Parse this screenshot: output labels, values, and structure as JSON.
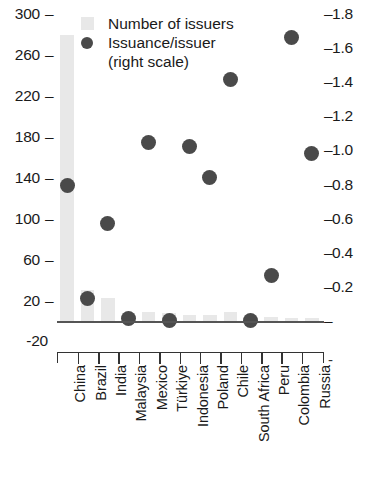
{
  "chart_data": {
    "type": "bar",
    "title": "",
    "subtitle": "",
    "xlabel": "",
    "ylabel": "",
    "y2label": "",
    "grid": false,
    "legend_position": "top-left",
    "categories": [
      "China",
      "Brazil",
      "India",
      "Malaysia",
      "Mexico",
      "Türkiye",
      "Indonesia",
      "Poland",
      "Chile",
      "South Africa",
      "Peru",
      "Colombia",
      "Russia"
    ],
    "ylim": [
      -20,
      300
    ],
    "y2lim": [
      0.0,
      1.8
    ],
    "yticks": [
      "300",
      "260",
      "220",
      "180",
      "140",
      "100",
      "60",
      "20",
      "-20"
    ],
    "ytick_values": [
      300,
      260,
      220,
      180,
      140,
      100,
      60,
      20,
      -20
    ],
    "y2ticks": [
      "1.8",
      "1.6",
      "1.4",
      "1.2",
      "1.0",
      "0.8",
      "0.6",
      "0.4",
      "0.2",
      "-"
    ],
    "y2tick_values": [
      1.8,
      1.6,
      1.4,
      1.2,
      1.0,
      0.8,
      0.6,
      0.4,
      0.2,
      0.0
    ],
    "series": [
      {
        "name": "Number of issuers",
        "type": "bar",
        "axis": "left",
        "color": "#e8e8e8",
        "values": [
          280,
          31,
          23,
          9,
          10,
          9,
          7,
          7,
          10,
          6,
          5,
          4,
          4
        ]
      },
      {
        "name": "Issuance/issuer (right scale)",
        "type": "scatter",
        "axis": "right",
        "color": "#4a4a4a",
        "values": [
          0.8,
          0.14,
          0.58,
          0.02,
          1.05,
          0.01,
          1.03,
          0.85,
          1.42,
          0.01,
          0.27,
          1.67,
          0.99
        ]
      }
    ]
  },
  "legend": {
    "item1": "Number of issuers",
    "item2": "Issuance/issuer",
    "item2_sub": "(right scale)"
  },
  "axis": {
    "right_endcap": "-"
  }
}
